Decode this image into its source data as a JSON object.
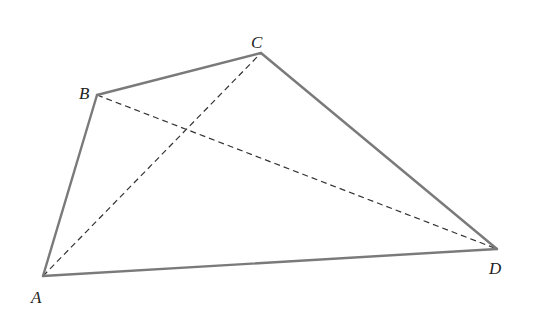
{
  "diagram": {
    "type": "quadrilateral-with-diagonals",
    "colors": {
      "edge": "#7a7a7a",
      "diagonal": "#333333",
      "label": "#222222",
      "background": "#ffffff"
    },
    "vertices": [
      {
        "id": "A",
        "label": "A",
        "x": 43,
        "y": 276,
        "label_x": 31,
        "label_y": 303
      },
      {
        "id": "B",
        "label": "B",
        "x": 97,
        "y": 95,
        "label_x": 79,
        "label_y": 99
      },
      {
        "id": "C",
        "label": "C",
        "x": 261,
        "y": 53,
        "label_x": 251,
        "label_y": 48
      },
      {
        "id": "D",
        "label": "D",
        "x": 497,
        "y": 249,
        "label_x": 489,
        "label_y": 274
      }
    ],
    "edges": [
      {
        "from": "A",
        "to": "B",
        "style": "solid"
      },
      {
        "from": "B",
        "to": "C",
        "style": "solid"
      },
      {
        "from": "C",
        "to": "D",
        "style": "solid"
      },
      {
        "from": "D",
        "to": "A",
        "style": "solid"
      }
    ],
    "diagonals": [
      {
        "from": "A",
        "to": "C",
        "style": "dashed"
      },
      {
        "from": "B",
        "to": "D",
        "style": "dashed"
      }
    ]
  }
}
